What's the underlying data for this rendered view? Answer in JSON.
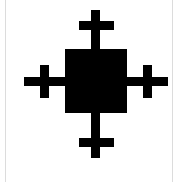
{
  "image": {
    "kind": "monochrome-glyph",
    "title": "Cross-tipped square symbol",
    "alt_text": "Black filled square with a plus sign extending from each of its four sides",
    "width": 179,
    "height": 182
  },
  "colors": {
    "background": "#FFFFFF",
    "foreground": "#000000",
    "edge_rule": "#DCDCDC"
  },
  "glyph": {
    "name": "square-with-four-crosses",
    "center_square": {
      "x": 65,
      "y": 49,
      "width": 62,
      "height": 64
    },
    "stroke_thickness": 9,
    "vertical_stem": {
      "x": 91,
      "top": 10,
      "bottom": 158
    },
    "horizontal_stem": {
      "y": 77,
      "left": 24,
      "right": 168
    },
    "arms": [
      {
        "name": "top-cross",
        "bar_x": 79,
        "bar_y": 21,
        "bar_width": 35,
        "bar_height": 9
      },
      {
        "name": "bottom-cross",
        "bar_x": 79,
        "bar_y": 138,
        "bar_width": 35,
        "bar_height": 9
      },
      {
        "name": "left-cross",
        "bar_x": 40,
        "bar_y": 65,
        "bar_width": 9,
        "bar_height": 33
      },
      {
        "name": "right-cross",
        "bar_x": 143,
        "bar_y": 65,
        "bar_width": 9,
        "bar_height": 33
      }
    ]
  },
  "edge_rules": [
    {
      "name": "left-edge-rule",
      "x": 5
    },
    {
      "name": "right-edge-rule",
      "x": 172
    }
  ]
}
